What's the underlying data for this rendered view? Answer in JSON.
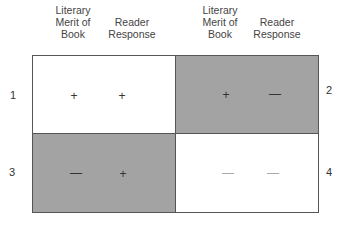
{
  "headers": [
    {
      "text": "Literary Merit of Book"
    },
    {
      "text": "Reader Response"
    },
    {
      "text": "Literary Merit of Book"
    },
    {
      "text": "Reader Response"
    }
  ],
  "quadrants": [
    {
      "number": "1",
      "merit": "+",
      "response": "+",
      "shade": "white"
    },
    {
      "number": "2",
      "merit": "+",
      "response": "—",
      "shade": "gray"
    },
    {
      "number": "3",
      "merit": "—",
      "response": "+",
      "shade": "gray"
    },
    {
      "number": "4",
      "merit": "—",
      "response": "—",
      "shade": "white"
    }
  ],
  "colors": {
    "gray": "#a3a3a3",
    "white": "#ffffff",
    "border": "#555555"
  }
}
